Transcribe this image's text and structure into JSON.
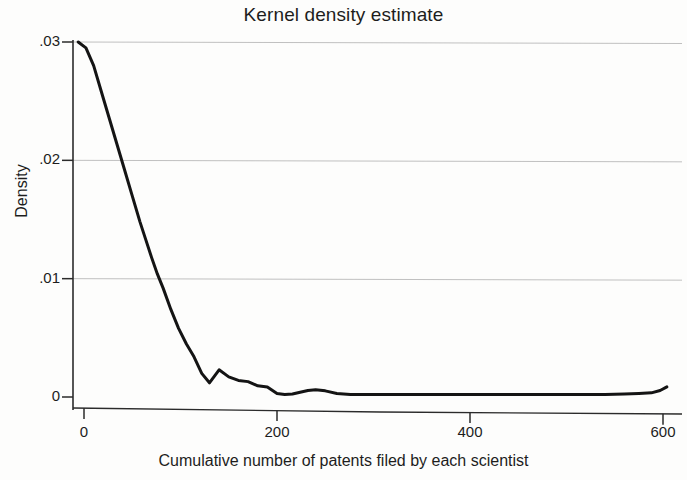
{
  "chart_data": {
    "type": "line",
    "title": "Kernel density estimate",
    "xlabel": "Cumulative number of patents filed by each scientist",
    "ylabel": "Density",
    "xlim": [
      -10,
      610
    ],
    "ylim": [
      0,
      0.0305
    ],
    "grid": true,
    "grid_axis": "y",
    "legend": null,
    "xticks": [
      0,
      200,
      400,
      600
    ],
    "xtick_labels": [
      "0",
      "200",
      "400",
      "600"
    ],
    "yticks": [
      0,
      0.01,
      0.02,
      0.03
    ],
    "ytick_labels": [
      "0",
      ".01",
      ".02",
      ".03"
    ],
    "series": [
      {
        "name": "Kernel density",
        "color": "#141414",
        "linewidth": 3,
        "x": [
          -6,
          2,
          10,
          18,
          26,
          34,
          42,
          50,
          58,
          64,
          70,
          76,
          82,
          90,
          98,
          106,
          114,
          122,
          130,
          140,
          150,
          160,
          170,
          180,
          190,
          200,
          208,
          216,
          224,
          232,
          240,
          250,
          262,
          276,
          290,
          305,
          320,
          340,
          360,
          380,
          400,
          420,
          440,
          460,
          480,
          500,
          520,
          540,
          560,
          575,
          588,
          597,
          604
        ],
        "y": [
          0.03,
          0.0295,
          0.028,
          0.0258,
          0.0236,
          0.0214,
          0.0192,
          0.017,
          0.0148,
          0.0133,
          0.0118,
          0.0104,
          0.0092,
          0.0074,
          0.0058,
          0.0045,
          0.0034,
          0.002,
          0.0012,
          0.0023,
          0.0017,
          0.0014,
          0.0013,
          0.00095,
          0.00085,
          0.0003,
          0.00022,
          0.00025,
          0.0004,
          0.00055,
          0.00062,
          0.00052,
          0.0003,
          0.00022,
          0.00022,
          0.00022,
          0.00022,
          0.00022,
          0.00022,
          0.00022,
          0.00022,
          0.00022,
          0.00022,
          0.00022,
          0.00022,
          0.00022,
          0.00022,
          0.00022,
          0.00025,
          0.0003,
          0.00035,
          0.00055,
          0.00085
        ]
      }
    ],
    "annotations": []
  },
  "figure": {
    "title": "Kernel density estimate",
    "xlabel": "Cumulative number of patents filed by each scientist",
    "ylabel": "Density",
    "ytick_labels": [
      "0",
      ".01",
      ".02",
      ".03"
    ],
    "xtick_labels": [
      "0",
      "200",
      "400",
      "600"
    ],
    "axis_color": "#2b2b2b",
    "grid_color": "#b9b9b9",
    "line_color": "#141414",
    "background": "#fdfdfc"
  }
}
